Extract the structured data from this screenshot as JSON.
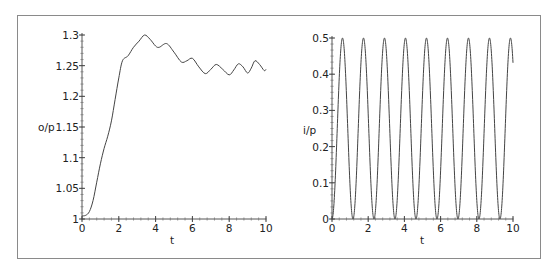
{
  "chart_data": [
    {
      "type": "line",
      "title": "",
      "xlabel": "t",
      "ylabel": "o/p",
      "xlim": [
        0,
        10
      ],
      "ylim": [
        1,
        1.3
      ],
      "xticks": [
        0,
        2,
        4,
        6,
        8,
        10
      ],
      "xtick_labels": [
        "0",
        "2",
        "4",
        "6",
        "8",
        "10"
      ],
      "yticks": [
        1,
        1.05,
        1.1,
        1.15,
        1.2,
        1.25,
        1.3
      ],
      "ytick_labels": [
        "1",
        "1.05",
        "1.1",
        "1.15",
        "1.2",
        "1.25",
        "1.3"
      ],
      "grid": false,
      "legend": null,
      "series": [
        {
          "name": "o/p",
          "x": [
            0,
            0.2,
            0.4,
            0.6,
            0.8,
            1.0,
            1.2,
            1.4,
            1.6,
            1.8,
            2.0,
            2.2,
            2.5,
            2.8,
            3.1,
            3.4,
            3.7,
            4.0,
            4.2,
            4.6,
            5.0,
            5.4,
            5.7,
            6.0,
            6.35,
            6.7,
            7.0,
            7.3,
            7.65,
            8.0,
            8.25,
            8.5,
            8.75,
            9.0,
            9.2,
            9.4,
            9.65,
            9.9,
            10.0
          ],
          "values": [
            1.005,
            1.006,
            1.012,
            1.03,
            1.06,
            1.09,
            1.115,
            1.135,
            1.16,
            1.195,
            1.23,
            1.258,
            1.266,
            1.28,
            1.29,
            1.3,
            1.293,
            1.282,
            1.28,
            1.286,
            1.272,
            1.256,
            1.258,
            1.262,
            1.248,
            1.237,
            1.244,
            1.252,
            1.244,
            1.235,
            1.243,
            1.253,
            1.248,
            1.238,
            1.246,
            1.258,
            1.252,
            1.242,
            1.244
          ]
        }
      ]
    },
    {
      "type": "line",
      "title": "",
      "xlabel": "t",
      "ylabel": "i/p",
      "xlim": [
        0,
        10
      ],
      "ylim": [
        0,
        0.5
      ],
      "xticks": [
        0,
        2,
        4,
        6,
        8,
        10
      ],
      "xtick_labels": [
        "0",
        "2",
        "4",
        "6",
        "8",
        "10"
      ],
      "yticks": [
        0,
        0.1,
        0.2,
        0.3,
        0.4,
        0.5
      ],
      "ytick_labels": [
        "0",
        "0.1",
        "0.2",
        "0.3",
        "0.4",
        "0.5"
      ],
      "grid": false,
      "legend": null,
      "series": [
        {
          "name": "i/p",
          "formula": "0.25*(1-cos(2*pi*t/1.16))",
          "period": 1.16,
          "amplitude": 0.5,
          "peaks_t": [
            0.58,
            1.74,
            2.9,
            4.06,
            5.22,
            6.38,
            7.54,
            8.7,
            9.86
          ],
          "troughs_t": [
            0,
            1.16,
            2.32,
            3.48,
            4.64,
            5.8,
            6.96,
            8.12,
            9.28
          ],
          "end_value": 0.46
        }
      ]
    }
  ]
}
